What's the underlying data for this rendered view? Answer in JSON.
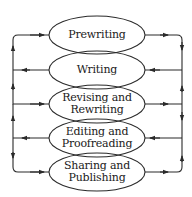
{
  "diagram": {
    "type": "writing-process-cycle",
    "stroke_color": "#2a2a2a",
    "background": "#ffffff",
    "stages": [
      {
        "line1": "Prewriting",
        "line2": ""
      },
      {
        "line1": "Writing",
        "line2": ""
      },
      {
        "line1": "Revising and",
        "line2": "Rewriting"
      },
      {
        "line1": "Editing and",
        "line2": "Proofreading"
      },
      {
        "line1": "Sharing and",
        "line2": "Publishing"
      }
    ]
  }
}
